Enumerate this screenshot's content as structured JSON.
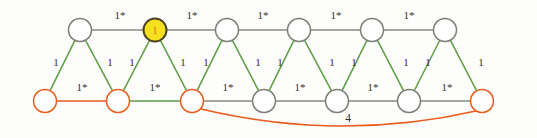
{
  "figure": {
    "name": "weighted-graph-triangular-strip",
    "background": "#fdfdfb",
    "width": 537,
    "height": 138
  },
  "colors": {
    "edge_gray": "#8a8a82",
    "edge_green": "#5d9e43",
    "edge_orange": "#ea5a19",
    "node_stroke_gray": "#7d7d75",
    "node_stroke_orange": "#ea5a19",
    "node_fill_white": "#ffffff",
    "node_fill_highlight": "#f5e120",
    "node_stroke_highlight": "#4a4320",
    "label_text": "#35312e",
    "highlight_label_text": "#e8761b"
  },
  "legend": {
    "starred_weight": "1*",
    "plain_weight": "1",
    "long_edge_weight": "4"
  },
  "nodes": [
    {
      "id": "t1",
      "row": "top",
      "cx": 80,
      "cy": 30,
      "r": 11.5,
      "fill": "#ffffff",
      "stroke": "#7d7d75",
      "label": ""
    },
    {
      "id": "t2",
      "row": "top",
      "cx": 155,
      "cy": 30,
      "r": 11.5,
      "fill": "#f5e120",
      "stroke": "#4a4320",
      "label": "1"
    },
    {
      "id": "t3",
      "row": "top",
      "cx": 227,
      "cy": 30,
      "r": 11.5,
      "fill": "#ffffff",
      "stroke": "#7d7d75",
      "label": ""
    },
    {
      "id": "t4",
      "row": "top",
      "cx": 299,
      "cy": 30,
      "r": 11.5,
      "fill": "#ffffff",
      "stroke": "#7d7d75",
      "label": ""
    },
    {
      "id": "t5",
      "row": "top",
      "cx": 372,
      "cy": 30,
      "r": 11.5,
      "fill": "#ffffff",
      "stroke": "#7d7d75",
      "label": ""
    },
    {
      "id": "t6",
      "row": "top",
      "cx": 445,
      "cy": 30,
      "r": 11.5,
      "fill": "#ffffff",
      "stroke": "#7d7d75",
      "label": ""
    },
    {
      "id": "b1",
      "row": "bottom",
      "cx": 45,
      "cy": 101,
      "r": 11.5,
      "fill": "#ffffff",
      "stroke": "#ea5a19",
      "label": ""
    },
    {
      "id": "b2",
      "row": "bottom",
      "cx": 118,
      "cy": 101,
      "r": 11.5,
      "fill": "#ffffff",
      "stroke": "#ea5a19",
      "label": ""
    },
    {
      "id": "b3",
      "row": "bottom",
      "cx": 192,
      "cy": 101,
      "r": 11.5,
      "fill": "#ffffff",
      "stroke": "#ea5a19",
      "label": ""
    },
    {
      "id": "b4",
      "row": "bottom",
      "cx": 264,
      "cy": 101,
      "r": 11.5,
      "fill": "#ffffff",
      "stroke": "#7d7d75",
      "label": ""
    },
    {
      "id": "b5",
      "row": "bottom",
      "cx": 337,
      "cy": 101,
      "r": 11.5,
      "fill": "#ffffff",
      "stroke": "#7d7d75",
      "label": ""
    },
    {
      "id": "b6",
      "row": "bottom",
      "cx": 409,
      "cy": 101,
      "r": 11.5,
      "fill": "#ffffff",
      "stroke": "#7d7d75",
      "label": ""
    },
    {
      "id": "b7",
      "row": "bottom",
      "cx": 482,
      "cy": 101,
      "r": 11.5,
      "fill": "#ffffff",
      "stroke": "#ea5a19",
      "label": ""
    }
  ],
  "edges": [
    {
      "id": "e-t1-t2",
      "from": "t1",
      "to": "t2",
      "color": "#8a8a82",
      "weight": "1*",
      "lx": 120,
      "ly": 19
    },
    {
      "id": "e-t2-t3",
      "from": "t2",
      "to": "t3",
      "color": "#8a8a82",
      "weight": "1*",
      "lx": 192,
      "ly": 19
    },
    {
      "id": "e-t3-t4",
      "from": "t3",
      "to": "t4",
      "color": "#8a8a82",
      "weight": "1*",
      "lx": 263,
      "ly": 19
    },
    {
      "id": "e-t4-t5",
      "from": "t4",
      "to": "t5",
      "color": "#8a8a82",
      "weight": "1*",
      "lx": 336,
      "ly": 19
    },
    {
      "id": "e-t5-t6",
      "from": "t5",
      "to": "t6",
      "color": "#8a8a82",
      "weight": "1*",
      "lx": 409,
      "ly": 19
    },
    {
      "id": "e-b1-b2",
      "from": "b1",
      "to": "b2",
      "color": "#ea5a19",
      "weight": "1*",
      "lx": 82,
      "ly": 91
    },
    {
      "id": "e-b2-b3",
      "from": "b2",
      "to": "b3",
      "color": "#5d9e43",
      "weight": "1*",
      "lx": 155,
      "ly": 91
    },
    {
      "id": "e-b3-b4",
      "from": "b3",
      "to": "b4",
      "color": "#8a8a82",
      "weight": "1*",
      "lx": 228,
      "ly": 91
    },
    {
      "id": "e-b4-b5",
      "from": "b4",
      "to": "b5",
      "color": "#8a8a82",
      "weight": "1*",
      "lx": 300,
      "ly": 91
    },
    {
      "id": "e-b5-b6",
      "from": "b5",
      "to": "b6",
      "color": "#8a8a82",
      "weight": "1*",
      "lx": 373,
      "ly": 91
    },
    {
      "id": "e-b6-b7",
      "from": "b6",
      "to": "b7",
      "color": "#8a8a82",
      "weight": "1*",
      "lx": 447,
      "ly": 91
    },
    {
      "id": "e-t1-b1",
      "from": "t1",
      "to": "b1",
      "color": "#5d9e43",
      "weight": "1",
      "lx": 56,
      "ly": 66
    },
    {
      "id": "e-t1-b2",
      "from": "t1",
      "to": "b2",
      "color": "#5d9e43",
      "weight": "1",
      "lx": 110,
      "ly": 66
    },
    {
      "id": "e-t2-b2",
      "from": "t2",
      "to": "b2",
      "color": "#5d9e43",
      "weight": "1",
      "lx": 132,
      "ly": 66
    },
    {
      "id": "e-t2-b3",
      "from": "t2",
      "to": "b3",
      "color": "#5d9e43",
      "weight": "1",
      "lx": 183,
      "ly": 66
    },
    {
      "id": "e-t3-b3",
      "from": "t3",
      "to": "b3",
      "color": "#5d9e43",
      "weight": "1",
      "lx": 206,
      "ly": 66
    },
    {
      "id": "e-t3-b4",
      "from": "t3",
      "to": "b4",
      "color": "#5d9e43",
      "weight": "1",
      "lx": 258,
      "ly": 66
    },
    {
      "id": "e-t4-b4",
      "from": "t4",
      "to": "b4",
      "color": "#5d9e43",
      "weight": "1",
      "lx": 280,
      "ly": 66
    },
    {
      "id": "e-t4-b5",
      "from": "t4",
      "to": "b5",
      "color": "#5d9e43",
      "weight": "1",
      "lx": 332,
      "ly": 66
    },
    {
      "id": "e-t5-b5",
      "from": "t5",
      "to": "b5",
      "color": "#5d9e43",
      "weight": "1",
      "lx": 354,
      "ly": 66
    },
    {
      "id": "e-t5-b6",
      "from": "t5",
      "to": "b6",
      "color": "#5d9e43",
      "weight": "1",
      "lx": 406,
      "ly": 66
    },
    {
      "id": "e-t6-b6",
      "from": "t6",
      "to": "b6",
      "color": "#5d9e43",
      "weight": "1",
      "lx": 428,
      "ly": 66
    },
    {
      "id": "e-t6-b7",
      "from": "t6",
      "to": "b7",
      "color": "#5d9e43",
      "weight": "1",
      "lx": 481,
      "ly": 66
    }
  ],
  "curved_edge": {
    "id": "e-b3-b7-long",
    "from": "b3",
    "to": "b7",
    "color": "#ea5a19",
    "weight": "4",
    "lx": 348,
    "ly": 122,
    "path": "M 201 109 Q 340 142 476 111"
  }
}
